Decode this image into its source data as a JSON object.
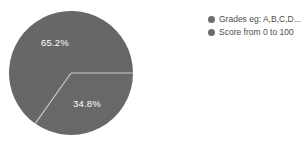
{
  "chart_data": {
    "type": "pie",
    "title": "",
    "categories": [
      "Grades eg: A,B,C,D...",
      "Score from 0 to 100"
    ],
    "values": [
      65.2,
      34.8
    ],
    "value_unit": "%",
    "data_labels": [
      "65.2%",
      "34.8%"
    ],
    "colors": [
      "#676767",
      "#686868"
    ],
    "legend_position": "right",
    "grid": false,
    "start_angle_deg": 0,
    "direction": "counterclockwise",
    "divider_color": "#c9c9c9",
    "background": "#ffffff",
    "label_color": "#ffffff",
    "slices": [
      {
        "label": "Grades eg: A,B,C,D...",
        "value": 65.2,
        "data_label": "65.2%",
        "color": "#676767"
      },
      {
        "label": "Score from 0 to 100",
        "value": 34.8,
        "data_label": "34.8%",
        "color": "#686868"
      }
    ]
  },
  "legend": {
    "items": [
      {
        "label": "Grades eg: A,B,C,D...",
        "color": "#6b6b6b"
      },
      {
        "label": "Score from 0 to 100",
        "color": "#6b6b6b"
      }
    ]
  }
}
